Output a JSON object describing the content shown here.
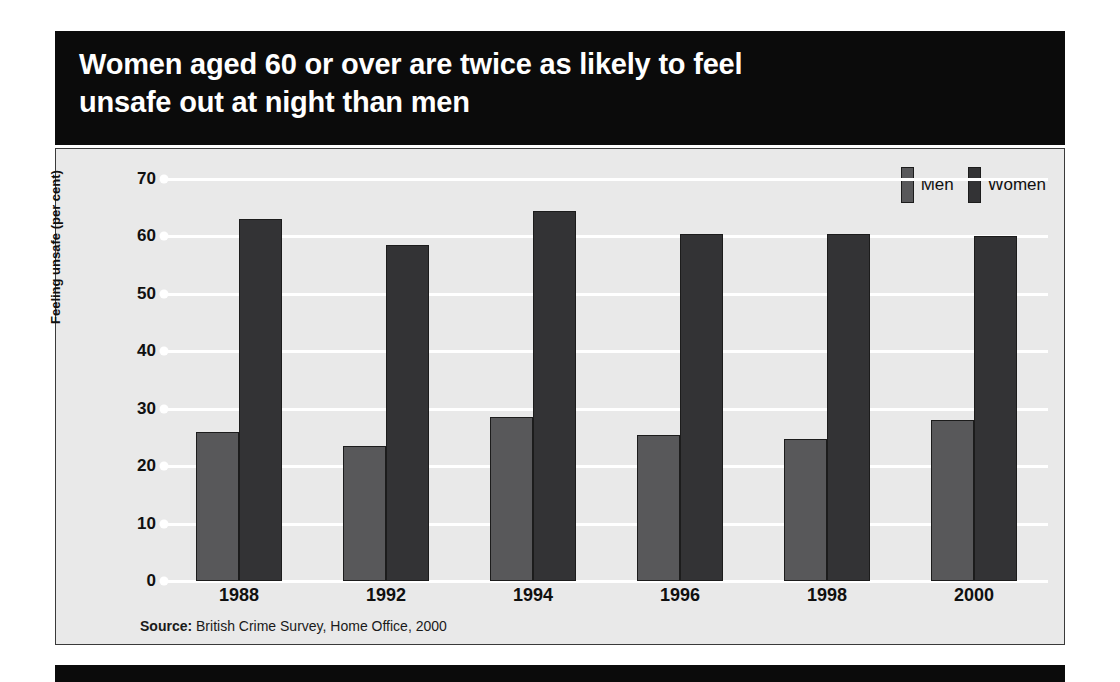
{
  "title": {
    "line1": "Women aged 60 or over are twice as likely to feel",
    "line2": "unsafe out at night than men"
  },
  "source": {
    "label": "Source:",
    "text": " British Crime Survey, Home Office, 2000"
  },
  "colors": {
    "men": "#58585a",
    "women": "#333335",
    "panel_background": "#e9e9e9",
    "banner": "#0b0b0b",
    "gridline": "#ffffff",
    "bar_outline": "#1c1c1c"
  },
  "chart_data": {
    "type": "bar",
    "title": "Women aged 60 or over are twice as likely to feel unsafe out at night than men",
    "xlabel": "",
    "ylabel": "Feeling unsafe (per cent)",
    "categories": [
      "1988",
      "1992",
      "1994",
      "1996",
      "1998",
      "2000"
    ],
    "series": [
      {
        "name": "Men",
        "values": [
          26,
          23.5,
          28.5,
          25.5,
          24.8,
          28
        ]
      },
      {
        "name": "Women",
        "values": [
          63,
          58.5,
          64.5,
          60.5,
          60.5,
          60
        ]
      }
    ],
    "ylim": [
      0,
      70
    ],
    "yticks": [
      0,
      10,
      20,
      30,
      40,
      50,
      60,
      70
    ],
    "ytick_labels": [
      "0",
      "10",
      "20",
      "30",
      "40",
      "50",
      "60",
      "70"
    ],
    "grid": true,
    "legend_position": "top-right",
    "source": "Source: British Crime Survey, Home Office, 2000"
  }
}
